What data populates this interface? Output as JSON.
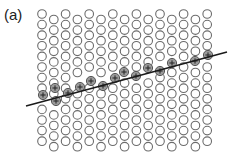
{
  "figure": {
    "panel_label": "(a)",
    "colors": {
      "background": "#ffffff",
      "circle_stroke": "#6b6b6b",
      "charged_fill": "#9a9a9a",
      "charged_stroke": "#555555",
      "plus_color": "#222222",
      "line_color": "#1a1a1a",
      "label_color": "#222222"
    },
    "lattice": {
      "columns": 15,
      "x_start": 42,
      "x_step": 11.8,
      "even_column_y_start": 14,
      "odd_column_y_start": 19.5,
      "y_step": 10.6,
      "rows": 13,
      "circle_radius": 4.3
    },
    "line": {
      "x1": 26,
      "y1": 106,
      "x2": 227,
      "y2": 52
    },
    "charged_particles": [
      {
        "x": 43,
        "y": 95
      },
      {
        "x": 55,
        "y": 88
      },
      {
        "x": 56,
        "y": 101
      },
      {
        "x": 68,
        "y": 93
      },
      {
        "x": 80,
        "y": 87
      },
      {
        "x": 91,
        "y": 81
      },
      {
        "x": 103,
        "y": 86
      },
      {
        "x": 115,
        "y": 78
      },
      {
        "x": 124,
        "y": 72
      },
      {
        "x": 136,
        "y": 76
      },
      {
        "x": 148,
        "y": 68
      },
      {
        "x": 160,
        "y": 71
      },
      {
        "x": 172,
        "y": 63
      },
      {
        "x": 195,
        "y": 61
      },
      {
        "x": 208,
        "y": 55
      }
    ],
    "plus_symbol": "+"
  }
}
